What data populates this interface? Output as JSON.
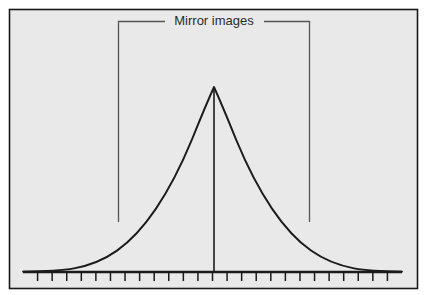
{
  "figure": {
    "title": "",
    "background_color": "#ffffff",
    "panel_fill": "#e9e9e9",
    "panel_border_color": "#1a1a1a",
    "curve_color": "#1a1a1a",
    "axis_color": "#1a1a1a",
    "bracket_color": "#555555",
    "label_color": "#2b2b2b"
  },
  "annotations": {
    "bracket_label": "Mirror images"
  },
  "chart_data": {
    "type": "line",
    "title": "",
    "subtitle": "",
    "xlabel": "",
    "ylabel": "",
    "grid": false,
    "legend": null,
    "annotations": [
      {
        "text": "Mirror images",
        "kind": "bracket-label",
        "describes": "symmetry of the normal distribution about its mean"
      }
    ],
    "axis": {
      "x_axis_visible": true,
      "y_axis_visible": false,
      "tick_count": 26,
      "tick_labels": [],
      "xlim": [
        -4,
        4
      ],
      "ylim": [
        0,
        1
      ]
    },
    "series": [
      {
        "name": "normal distribution",
        "x": [
          -4.0,
          -3.75,
          -3.5,
          -3.25,
          -3.0,
          -2.75,
          -2.5,
          -2.25,
          -2.0,
          -1.75,
          -1.5,
          -1.25,
          -1.0,
          -0.75,
          -0.5,
          -0.25,
          0.0,
          0.25,
          0.5,
          0.75,
          1.0,
          1.25,
          1.5,
          1.75,
          2.0,
          2.25,
          2.5,
          2.75,
          3.0,
          3.25,
          3.5,
          3.75,
          4.0
        ],
        "y": [
          0.0003,
          0.0009,
          0.0022,
          0.0051,
          0.0111,
          0.0228,
          0.0439,
          0.0796,
          0.1353,
          0.2163,
          0.3247,
          0.4578,
          0.6065,
          0.7548,
          0.8825,
          0.9692,
          1.0,
          0.9692,
          0.8825,
          0.7548,
          0.6065,
          0.4578,
          0.3247,
          0.2163,
          0.1353,
          0.0796,
          0.0439,
          0.0228,
          0.0111,
          0.0051,
          0.0022,
          0.0009,
          0.0003
        ]
      }
    ],
    "center_line": {
      "x": 0.0,
      "from_y": 0.0,
      "to_y": 1.0,
      "label": "mean / axis of symmetry"
    },
    "bracket": {
      "x_left": -1.46,
      "x_right": 1.46,
      "label": "Mirror images"
    }
  }
}
